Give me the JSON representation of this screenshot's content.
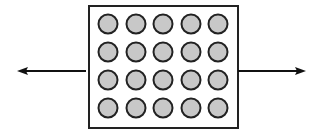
{
  "diagram": {
    "box": {
      "x": 89,
      "y": 6,
      "width": 149,
      "height": 122,
      "stroke": "#222222",
      "fill": "#ffffff"
    },
    "grid": {
      "rows": 4,
      "cols": 5,
      "col_centers": [
        108,
        136,
        163,
        191,
        218
      ],
      "row_centers": [
        24,
        52,
        80,
        108
      ],
      "radius": 9.5,
      "fill": "#c8c8c8",
      "stroke": "#222222"
    },
    "arrows": [
      {
        "name": "left-arrow",
        "x1": 86,
        "y1": 71,
        "x2": 17,
        "y2": 71,
        "color": "#111111"
      },
      {
        "name": "right-arrow",
        "x1": 238,
        "y1": 71,
        "x2": 306,
        "y2": 71,
        "color": "#111111"
      }
    ]
  }
}
